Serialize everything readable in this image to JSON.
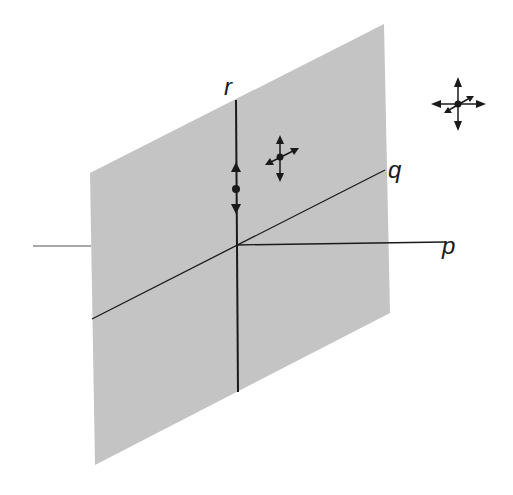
{
  "diagram": {
    "type": "3d-coordinate-plane",
    "colors": {
      "plane_fill": "#c4c4c4",
      "line": "#1a1a1a",
      "background": "#ffffff"
    },
    "plane": {
      "corners": [
        [
          90,
          173
        ],
        [
          384,
          24
        ],
        [
          390,
          313
        ],
        [
          95,
          465
        ]
      ]
    },
    "origin": [
      236,
      245
    ],
    "axes": [
      {
        "id": "p",
        "label": "p",
        "from": [
          33,
          246
        ],
        "to": [
          445,
          242
        ],
        "label_pos": [
          442,
          254
        ]
      },
      {
        "id": "q",
        "label": "q",
        "from": [
          92,
          319
        ],
        "to": [
          385,
          170
        ],
        "label_pos": [
          388,
          178
        ]
      },
      {
        "id": "r",
        "label": "r",
        "from": [
          236,
          100
        ],
        "to": [
          238,
          392
        ],
        "label_pos": [
          224,
          95
        ]
      }
    ],
    "markers": [
      {
        "id": "r-axis-point",
        "description": "point on r axis with up/down arrows",
        "center": [
          236,
          189
        ]
      },
      {
        "id": "in-plane-point",
        "description": "point in plane with arrows along r and q directions",
        "center": [
          280,
          157
        ]
      },
      {
        "id": "free-point",
        "description": "point off plane with arrows along p, q and r directions",
        "center": [
          458,
          104
        ]
      }
    ]
  }
}
